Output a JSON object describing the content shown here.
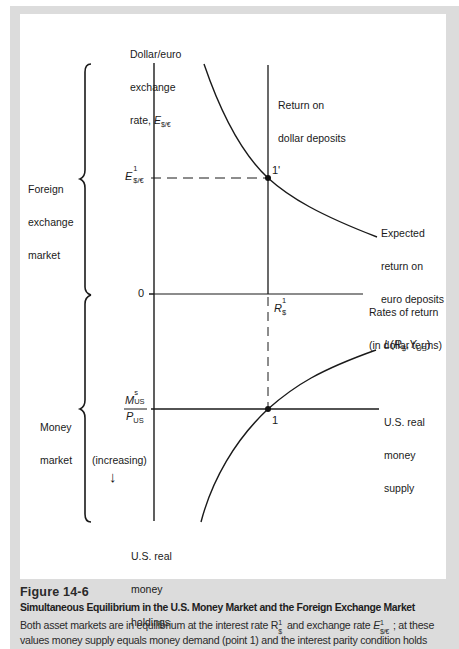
{
  "figure": {
    "number": "Figure 14-6",
    "title": "Simultaneous Equilibrium in the U.S. Money Market and the Foreign Exchange Market",
    "caption_line1_a": "Both asset markets are in equilibrium at the interest rate R",
    "caption_line1_b": " and exchange rate ",
    "caption_line1_c": "; at these",
    "caption_line2": "values money supply equals money demand (point 1) and the interest parity condition holds",
    "caption_symbol_R_sup": "1",
    "caption_symbol_R_sub": "$",
    "caption_symbol_E": "E",
    "caption_symbol_E_sup": "1",
    "caption_symbol_E_sub": "$/€"
  },
  "axes": {
    "vertical_axis_label_line1": "Dollar/euro",
    "vertical_axis_label_line2": "exchange",
    "vertical_axis_label_line3": "rate, ",
    "vertical_axis_symbol": "E",
    "vertical_axis_symbol_sub": "$/€",
    "horizontal_axis_label_line1": "Rates of return",
    "horizontal_axis_label_line2": "(in dollar terms)",
    "origin_label": "0",
    "lower_axis_label_line1": "U.S. real",
    "lower_axis_label_line2": "money",
    "lower_axis_label_line3": "holdings",
    "increasing_label": "(increasing)",
    "increasing_arrow": "↓"
  },
  "sections": {
    "foreign_exchange_line1": "Foreign",
    "foreign_exchange_line2": "exchange",
    "foreign_exchange_line3": "market",
    "money_market_line1": "Money",
    "money_market_line2": "market"
  },
  "curves": {
    "dollar_return_line1": "Return on",
    "dollar_return_line2": "dollar deposits",
    "euro_return_line1": "Expected",
    "euro_return_line2": "return on",
    "euro_return_line3": "euro deposits",
    "money_demand_L": "L(R",
    "money_demand_sub1": "$",
    "money_demand_mid": ",Y",
    "money_demand_sub2": "US",
    "money_demand_end": ")",
    "money_supply_line1": "U.S. real",
    "money_supply_line2": "money",
    "money_supply_line3": "supply"
  },
  "markers": {
    "E1_symbol": "E",
    "E1_sup": "1",
    "E1_sub": "$/€",
    "R1_symbol": "R",
    "R1_sup": "1",
    "R1_sub": "$",
    "MS_symbol": "M",
    "MS_sup": "s",
    "MS_sub": "US",
    "P_symbol": "P",
    "P_sub": "US",
    "point_1_prime": "1'",
    "point_1": "1"
  },
  "colors": {
    "frame": "#dcdcdc",
    "panel": "#ffffff",
    "ink": "#1a1a1a"
  }
}
